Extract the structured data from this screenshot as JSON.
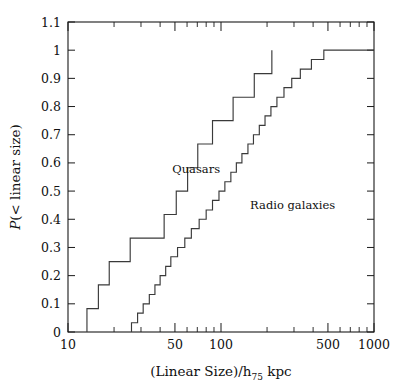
{
  "chart_data": {
    "type": "line",
    "subtype": "cumulative-step",
    "title": "",
    "xlabel": "(Linear Size)/h_75 kpc",
    "xlabel_parts": {
      "main": "(Linear Size)/h",
      "subscript": "75",
      "tail": " kpc"
    },
    "ylabel": "P(< linear size)",
    "ylabel_parts": {
      "italic": "P",
      "rest": "(< linear size)"
    },
    "xscale": "log",
    "yscale": "linear",
    "xlim": [
      10,
      1000
    ],
    "ylim": [
      0,
      1.1
    ],
    "grid": false,
    "legend_position": "inline-annotation",
    "xticks_major": [
      10,
      50,
      100,
      500,
      1000
    ],
    "xtick_labels": [
      "10",
      "50",
      "100",
      "500",
      "1000"
    ],
    "xticks_minor": [
      20,
      30,
      40,
      60,
      70,
      80,
      90,
      200,
      300,
      400,
      600,
      700,
      800,
      900
    ],
    "yticks": [
      0,
      0.1,
      0.2,
      0.3,
      0.4,
      0.5,
      0.6,
      0.7,
      0.8,
      0.9,
      1,
      1.1
    ],
    "ytick_labels": [
      "0",
      "0.1",
      "0.2",
      "0.3",
      "0.4",
      "0.5",
      "0.6",
      "0.7",
      "0.8",
      "0.9",
      "1",
      "1.1"
    ],
    "series": [
      {
        "name": "Quasars",
        "label": "Quasars",
        "color": "#3a3a3a",
        "annotation_x": 48,
        "annotation_y": 0.565,
        "n": 12,
        "x": [
          13.3,
          15.8,
          18.6,
          25.5,
          42.5,
          51.0,
          60.5,
          70.5,
          88.0,
          120.0,
          165.0,
          215.0
        ],
        "y": [
          0.083,
          0.167,
          0.25,
          0.333,
          0.417,
          0.5,
          0.583,
          0.667,
          0.75,
          0.833,
          0.917,
          1.0
        ]
      },
      {
        "name": "Radio galaxies",
        "label": "Radio galaxies",
        "color": "#3a3a3a",
        "annotation_x": 155,
        "annotation_y": 0.435,
        "n": 30,
        "x": [
          26.0,
          28.5,
          31.0,
          34.0,
          37.0,
          40.0,
          43.5,
          47.0,
          52.0,
          58.0,
          64.0,
          72.0,
          80.0,
          88.0,
          97.0,
          106.0,
          116.0,
          126.0,
          137.0,
          150.0,
          163.0,
          178.0,
          194.0,
          212.0,
          232.0,
          258.0,
          290.0,
          330.0,
          390.0,
          470.0
        ],
        "y": [
          0.033,
          0.067,
          0.1,
          0.133,
          0.167,
          0.2,
          0.233,
          0.267,
          0.3,
          0.333,
          0.367,
          0.4,
          0.433,
          0.467,
          0.5,
          0.533,
          0.567,
          0.6,
          0.633,
          0.667,
          0.7,
          0.733,
          0.767,
          0.8,
          0.833,
          0.867,
          0.9,
          0.933,
          0.967,
          1.0
        ]
      }
    ]
  }
}
